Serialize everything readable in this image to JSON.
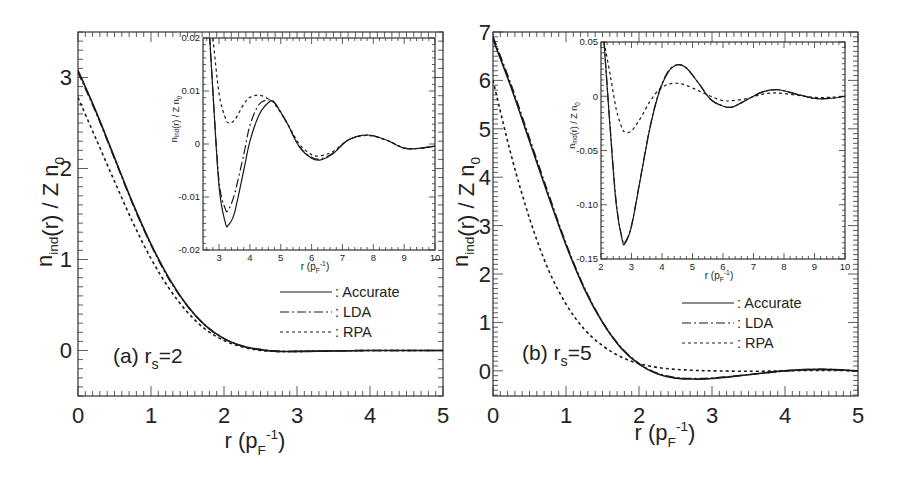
{
  "chart_data": [
    {
      "panel": "a",
      "type": "line",
      "annotation": "(a) r_s=2",
      "annotation_parts": {
        "prefix": "(a) r",
        "sub": "s",
        "suffix": "=2"
      },
      "xlabel": "r (p_F^-1)",
      "ylabel": "n_ind(r) / Z n_0",
      "xlim": [
        0,
        5
      ],
      "ylim": [
        -0.5,
        3.5
      ],
      "xticks": [
        "0",
        "1",
        "2",
        "3",
        "4",
        "5"
      ],
      "yticks": [
        "0",
        "1",
        "2",
        "3"
      ],
      "grid": false,
      "legend": {
        "position": "center-right",
        "entries": [
          ": Accurate",
          ": LDA",
          ": RPA"
        ]
      },
      "x": [
        0,
        0.25,
        0.5,
        0.75,
        1.0,
        1.25,
        1.5,
        1.75,
        2.0,
        2.25,
        2.5,
        2.75,
        3.0,
        3.5,
        4.0,
        4.5,
        5.0
      ],
      "series": [
        {
          "name": "Accurate",
          "style": "solid",
          "values": [
            3.08,
            2.62,
            2.12,
            1.62,
            1.17,
            0.79,
            0.49,
            0.27,
            0.13,
            0.05,
            0.01,
            -0.01,
            -0.01,
            -0.005,
            0.0,
            0.0,
            0.0
          ]
        },
        {
          "name": "LDA",
          "style": "dash-dot",
          "values": [
            3.06,
            2.61,
            2.11,
            1.61,
            1.16,
            0.78,
            0.49,
            0.27,
            0.13,
            0.05,
            0.01,
            -0.01,
            -0.01,
            -0.005,
            0.0,
            0.0,
            0.0
          ]
        },
        {
          "name": "RPA",
          "style": "dotted",
          "values": [
            2.78,
            2.32,
            1.86,
            1.41,
            1.01,
            0.68,
            0.42,
            0.23,
            0.11,
            0.04,
            0.0,
            -0.01,
            -0.01,
            -0.005,
            0.0,
            0.0,
            0.0
          ]
        }
      ],
      "inset": {
        "xlabel": "r (p_F^-1)",
        "ylabel": "n_ind(r) / Z n_0",
        "xlim": [
          2.48,
          10
        ],
        "ylim": [
          -0.02,
          0.02
        ],
        "xticks": [
          "3",
          "4",
          "5",
          "6",
          "7",
          "8",
          "9",
          "10"
        ],
        "yticks": [
          "0.02",
          "0.01",
          "0",
          "-0.01",
          "-0.02"
        ],
        "x": [
          2.6,
          2.8,
          3.0,
          3.2,
          3.3,
          3.5,
          3.8,
          4.0,
          4.3,
          4.6,
          4.8,
          5.2,
          5.6,
          6.0,
          6.3,
          6.7,
          7.2,
          7.8,
          8.4,
          9.0,
          9.5,
          10.0
        ],
        "series": [
          {
            "name": "Accurate",
            "style": "solid",
            "values": [
              0.03,
              0.01,
              -0.008,
              -0.0148,
              -0.0153,
              -0.013,
              -0.005,
              0.0005,
              0.0055,
              0.0078,
              0.0077,
              0.004,
              -0.0005,
              -0.0027,
              -0.003,
              -0.0018,
              0.0008,
              0.0017,
              0.0008,
              -0.0008,
              -0.0008,
              -0.0004
            ]
          },
          {
            "name": "LDA",
            "style": "dash-dot",
            "values": [
              0.03,
              0.01,
              -0.007,
              -0.0122,
              -0.0124,
              -0.0095,
              -0.002,
              0.0035,
              0.0075,
              0.0083,
              0.0078,
              0.004,
              -0.0005,
              -0.0025,
              -0.0028,
              -0.0017,
              0.0008,
              0.0017,
              0.0008,
              -0.0008,
              -0.0008,
              -0.0004
            ]
          },
          {
            "name": "RPA",
            "style": "dotted",
            "values": [
              0.03,
              0.02,
              0.0095,
              0.005,
              0.004,
              0.0045,
              0.0075,
              0.0088,
              0.0092,
              0.0085,
              0.0076,
              0.004,
              0.0,
              -0.002,
              -0.0022,
              -0.0014,
              0.0008,
              0.0016,
              0.0008,
              -0.0007,
              -0.0008,
              -0.0004
            ]
          }
        ]
      }
    },
    {
      "panel": "b",
      "type": "line",
      "annotation": "(b) r_s=5",
      "annotation_parts": {
        "prefix": "(b) r",
        "sub": "s",
        "suffix": "=5"
      },
      "xlabel": "r (p_F^-1)",
      "ylabel": "n_ind(r) / Z n_0",
      "xlim": [
        0,
        5
      ],
      "ylim": [
        -0.52,
        7.0
      ],
      "xticks": [
        "0",
        "1",
        "2",
        "3",
        "4",
        "5"
      ],
      "yticks": [
        "0",
        "1",
        "2",
        "3",
        "4",
        "5",
        "6",
        "7"
      ],
      "grid": false,
      "legend": {
        "position": "center-right",
        "entries": [
          ": Accurate",
          ": LDA",
          ": RPA"
        ]
      },
      "x": [
        0,
        0.25,
        0.5,
        0.75,
        1.0,
        1.25,
        1.5,
        1.75,
        2.0,
        2.25,
        2.5,
        2.75,
        3.0,
        3.5,
        4.0,
        4.5,
        5.0
      ],
      "series": [
        {
          "name": "Accurate",
          "style": "solid",
          "values": [
            6.85,
            5.85,
            4.75,
            3.65,
            2.6,
            1.7,
            1.0,
            0.48,
            0.14,
            -0.06,
            -0.15,
            -0.17,
            -0.16,
            -0.08,
            0.0,
            0.03,
            0.0
          ]
        },
        {
          "name": "LDA",
          "style": "dash-dot",
          "values": [
            6.9,
            5.9,
            4.8,
            3.7,
            2.63,
            1.72,
            1.01,
            0.49,
            0.15,
            -0.05,
            -0.14,
            -0.16,
            -0.15,
            -0.08,
            0.0,
            0.03,
            0.0
          ]
        },
        {
          "name": "RPA",
          "style": "dotted",
          "values": [
            6.0,
            4.45,
            3.15,
            2.12,
            1.38,
            0.86,
            0.52,
            0.29,
            0.15,
            0.07,
            0.03,
            0.01,
            0.0,
            -0.01,
            0.0,
            0.01,
            0.0
          ]
        }
      ],
      "inset": {
        "xlabel": "r (p_F^-1)",
        "ylabel": "n_ind(r) / Z n_0",
        "xlim": [
          2,
          10
        ],
        "ylim": [
          -0.15,
          0.05
        ],
        "xticks": [
          "2",
          "3",
          "4",
          "5",
          "6",
          "7",
          "8",
          "9",
          "10"
        ],
        "yticks": [
          "0.05",
          "0",
          "-0.05",
          "-0.10",
          "-0.15"
        ],
        "x": [
          2.1,
          2.3,
          2.5,
          2.7,
          2.8,
          3.0,
          3.3,
          3.6,
          3.9,
          4.2,
          4.5,
          4.8,
          5.2,
          5.6,
          6.0,
          6.3,
          6.8,
          7.3,
          7.8,
          8.4,
          9.0,
          9.5,
          10.0
        ],
        "series": [
          {
            "name": "Accurate",
            "style": "solid",
            "values": [
              0.05,
              -0.03,
              -0.1,
              -0.133,
              -0.135,
              -0.12,
              -0.075,
              -0.03,
              0.003,
              0.022,
              0.029,
              0.026,
              0.012,
              -0.003,
              -0.009,
              -0.01,
              -0.003,
              0.004,
              0.006,
              0.002,
              -0.002,
              -0.002,
              0.0
            ]
          },
          {
            "name": "LDA",
            "style": "dash-dot",
            "values": [
              0.05,
              -0.028,
              -0.098,
              -0.132,
              -0.134,
              -0.119,
              -0.074,
              -0.029,
              0.004,
              0.023,
              0.029,
              0.026,
              0.012,
              -0.003,
              -0.009,
              -0.01,
              -0.003,
              0.004,
              0.006,
              0.002,
              -0.002,
              -0.002,
              0.0
            ]
          },
          {
            "name": "RPA",
            "style": "dotted",
            "values": [
              0.05,
              0.02,
              -0.012,
              -0.03,
              -0.033,
              -0.032,
              -0.02,
              -0.005,
              0.006,
              0.011,
              0.012,
              0.01,
              0.005,
              0.0,
              -0.004,
              -0.004,
              -0.002,
              0.002,
              0.003,
              0.001,
              -0.001,
              -0.001,
              0.0
            ]
          }
        ]
      }
    }
  ],
  "labels": {
    "panel_a": {
      "ylabel_n": "n",
      "ylabel_sub": "ind",
      "ylabel_rest": "(r) / Z n",
      "ylabel_sub0": "0",
      "xlabel_r": "r",
      "xlabel_p": "(p",
      "xlabel_sub": "F",
      "xlabel_sup": "-1",
      "xlabel_close": ")",
      "annotation_prefix": "(a) r",
      "annotation_sub": "s",
      "annotation_suffix": "=2",
      "legend": [
        "Accurate",
        "LDA",
        "RPA"
      ]
    },
    "panel_b": {
      "ylabel_n": "n",
      "ylabel_sub": "ind",
      "ylabel_rest": "(r) / Z n",
      "ylabel_sub0": "0",
      "xlabel_r": "r",
      "xlabel_p": "(p",
      "xlabel_sub": "F",
      "xlabel_sup": "-1",
      "xlabel_close": ")",
      "annotation_prefix": "(b) r",
      "annotation_sub": "s",
      "annotation_suffix": "=5",
      "legend": [
        "Accurate",
        "LDA",
        "RPA"
      ]
    }
  },
  "colors": {
    "line": "#1a1a1a",
    "axis": "#333333",
    "background": "#ffffff"
  }
}
